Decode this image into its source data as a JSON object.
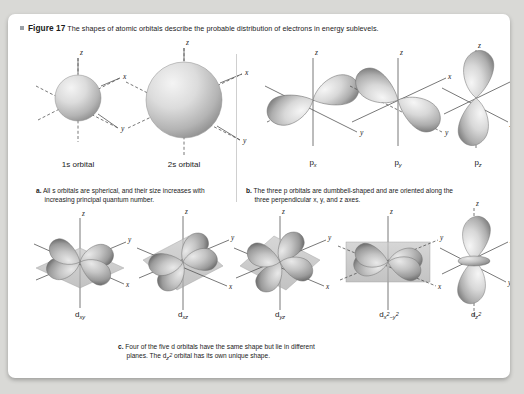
{
  "figure": {
    "label": "Figure 17",
    "caption": "The shapes of atomic orbitals describe the probable distribution of electrons in energy sublevels.",
    "bullet_icon": "square-bullet-icon"
  },
  "panel_a": {
    "key": "a.",
    "text": "All s orbitals are spherical, and their size increases with increasing principal quantum number.",
    "orbitals": [
      {
        "name": "1s orbital",
        "shape": "sphere",
        "axes": [
          "x",
          "y",
          "z"
        ]
      },
      {
        "name": "2s orbital",
        "shape": "sphere",
        "axes": [
          "x",
          "y",
          "z"
        ]
      }
    ]
  },
  "panel_b": {
    "key": "b.",
    "text": "The three p orbitals are dumbbell-shaped and are oriented along the three perpendicular x, y, and z axes.",
    "orbitals": [
      {
        "base": "p",
        "sub": "x",
        "shape": "dumbbell",
        "axis": "x",
        "axes": [
          "x",
          "y",
          "z"
        ]
      },
      {
        "base": "p",
        "sub": "y",
        "shape": "dumbbell",
        "axis": "y",
        "axes": [
          "x",
          "y",
          "z"
        ]
      },
      {
        "base": "p",
        "sub": "z",
        "shape": "dumbbell",
        "axis": "z",
        "axes": [
          "x",
          "y",
          "z"
        ]
      }
    ]
  },
  "panel_c": {
    "key": "c.",
    "text_line1": "Four of the five d orbitals have the same shape but lie in different",
    "text_line2_pre": "planes. The d",
    "text_line2_sub": "z2",
    "text_line2_post": " orbital has its own unique shape.",
    "orbitals": [
      {
        "base": "d",
        "sub": "xy",
        "sup": "",
        "shape": "cloverleaf",
        "plane": "xy",
        "axes": [
          "x",
          "y",
          "z"
        ]
      },
      {
        "base": "d",
        "sub": "xz",
        "sup": "",
        "shape": "cloverleaf",
        "plane": "xz",
        "axes": [
          "x",
          "y",
          "z"
        ]
      },
      {
        "base": "d",
        "sub": "yz",
        "sup": "",
        "shape": "cloverleaf",
        "plane": "yz",
        "axes": [
          "x",
          "y",
          "z"
        ]
      },
      {
        "base": "d",
        "sub": "x2-y2",
        "sup": "",
        "shape": "cloverleaf-on-axes",
        "plane": "xy",
        "axes": [
          "x",
          "y",
          "z"
        ]
      },
      {
        "base": "d",
        "sub": "z2",
        "sup": "",
        "shape": "dumbbell-with-torus",
        "plane": "z",
        "axes": [
          "x",
          "y",
          "z"
        ]
      }
    ]
  },
  "labels": {
    "s1": "1s orbital",
    "s2": "2s orbital",
    "p": "p",
    "px_sub": "x",
    "py_sub": "y",
    "pz_sub": "z",
    "d": "d",
    "dxy_sub": "xy",
    "dxz_sub": "xz",
    "dyz_sub": "yz",
    "dx2y2_pre": "x",
    "dx2y2_sup1": "2",
    "dx2y2_mid": "−y",
    "dx2y2_sup2": "2",
    "dz2_pre": "z",
    "dz2_sup": "2",
    "axis_x": "x",
    "axis_y": "y",
    "axis_z": "z"
  },
  "colors": {
    "page_background": "#d9d9d6",
    "card": "#ffffff",
    "text": "#1a1a1a",
    "axis": "#4a4a4a",
    "orbital_light": "#e8e8e8",
    "orbital_mid": "#b8b8b8",
    "orbital_dark": "#8a8a8a",
    "divider": "#cfcfcf"
  }
}
